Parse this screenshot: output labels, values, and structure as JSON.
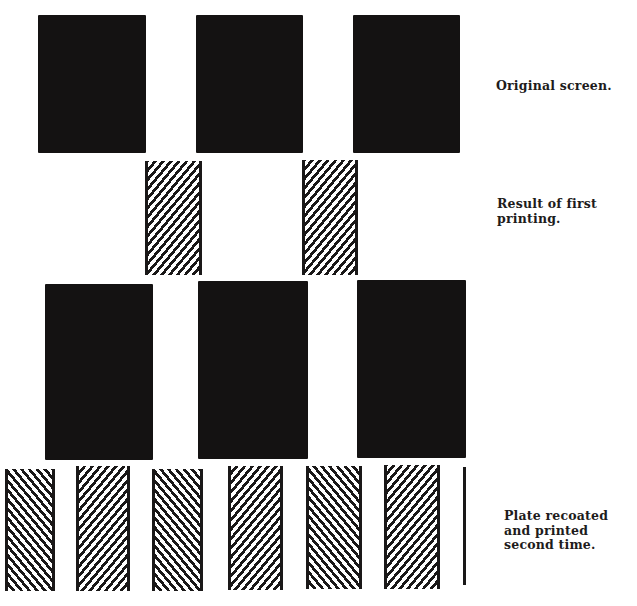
{
  "figure": {
    "rows": [
      {
        "id": "original-screen",
        "label": "Original screen.",
        "pattern": "solid",
        "shapes": [
          {
            "x": 38,
            "y": 15,
            "w": 108,
            "h": 138
          },
          {
            "x": 196,
            "y": 15,
            "w": 107,
            "h": 138
          },
          {
            "x": 353,
            "y": 15,
            "w": 107,
            "h": 138
          }
        ]
      },
      {
        "id": "first-printing",
        "label": "Result of first\nprinting.",
        "pattern": "hatch-forward",
        "shapes": [
          {
            "x": 145,
            "y": 161,
            "w": 57,
            "h": 114
          },
          {
            "x": 302,
            "y": 160,
            "w": 56,
            "h": 115
          }
        ]
      },
      {
        "id": "recoated-screen",
        "label": "",
        "pattern": "solid",
        "shapes": [
          {
            "x": 45,
            "y": 284,
            "w": 108,
            "h": 176
          },
          {
            "x": 198,
            "y": 281,
            "w": 110,
            "h": 178
          },
          {
            "x": 357,
            "y": 280,
            "w": 109,
            "h": 178
          }
        ]
      },
      {
        "id": "second-printing",
        "label": "Plate recoated\nand printed\nsecond time.",
        "pattern": "alternating-hatch",
        "shapes": [
          {
            "x": 5,
            "y": 469,
            "w": 50,
            "h": 122,
            "hatch": "back"
          },
          {
            "x": 76,
            "y": 466,
            "w": 54,
            "h": 125,
            "hatch": "fwd"
          },
          {
            "x": 152,
            "y": 469,
            "w": 51,
            "h": 122,
            "hatch": "back"
          },
          {
            "x": 228,
            "y": 466,
            "w": 55,
            "h": 124,
            "hatch": "fwd"
          },
          {
            "x": 306,
            "y": 466,
            "w": 56,
            "h": 123,
            "hatch": "back"
          },
          {
            "x": 384,
            "y": 465,
            "w": 56,
            "h": 124,
            "hatch": "fwd"
          }
        ],
        "trailing_line": {
          "x": 463,
          "y": 467,
          "w": 3,
          "h": 118
        }
      }
    ],
    "labels": [
      {
        "id": "label-original-screen",
        "text": "Original screen.",
        "x": 496,
        "y": 79
      },
      {
        "id": "label-first-printing",
        "text": "Result of first\nprinting.",
        "x": 497,
        "y": 197
      },
      {
        "id": "label-second-printing",
        "text": "Plate recoated\nand printed\nsecond time.",
        "x": 504,
        "y": 509
      }
    ],
    "colors": {
      "ink": "#141212",
      "paper": "#ffffff"
    }
  }
}
